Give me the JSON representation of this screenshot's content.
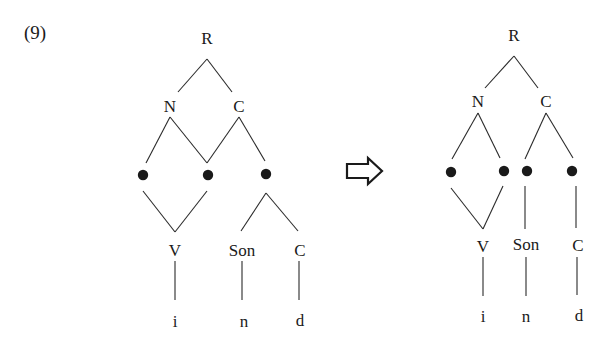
{
  "example_number": "(9)",
  "arrow": {
    "icon": "hollow-right-arrow-icon",
    "meaning": "derives / becomes"
  },
  "left_tree": {
    "root": "R",
    "level1": [
      "N",
      "C"
    ],
    "timing_slots": 3,
    "segments": [
      "V",
      "Son",
      "C"
    ],
    "phonemes": [
      "i",
      "n",
      "d"
    ]
  },
  "right_tree": {
    "root": "R",
    "level1": [
      "N",
      "C"
    ],
    "timing_slots": 4,
    "segments": [
      "V",
      "Son",
      "C"
    ],
    "phonemes": [
      "i",
      "n",
      "d"
    ]
  }
}
